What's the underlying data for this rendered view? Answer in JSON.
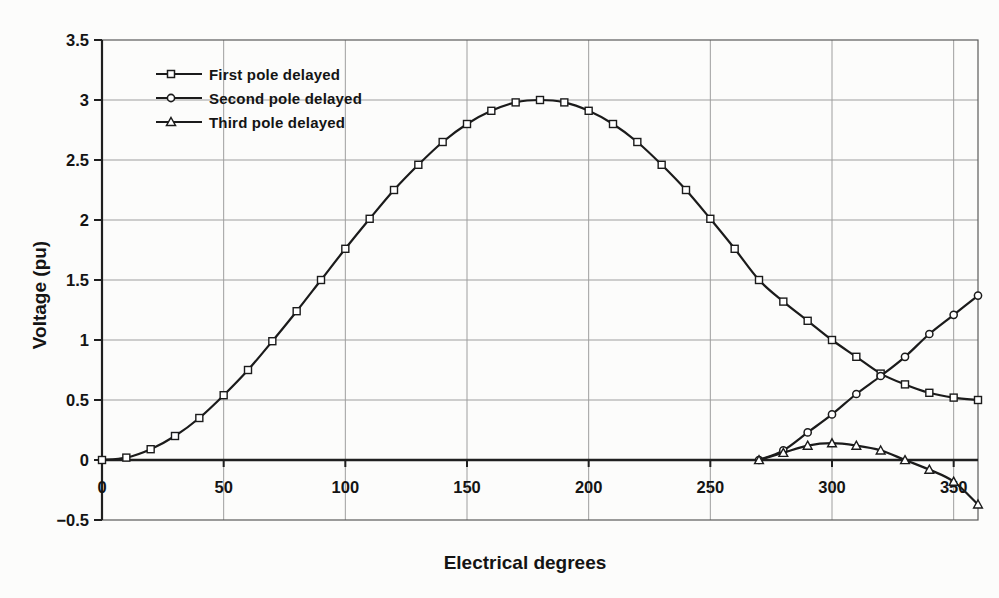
{
  "chart_data": {
    "type": "line",
    "title": "",
    "xlabel": "Electrical degrees",
    "ylabel": "Voltage (pu)",
    "xlim": [
      0,
      360
    ],
    "ylim": [
      -0.5,
      3.5
    ],
    "x_ticks": [
      0,
      50,
      100,
      150,
      200,
      250,
      300,
      350
    ],
    "y_ticks": [
      3.5,
      3,
      2.5,
      2,
      1.5,
      1,
      0.5,
      0,
      -0.5
    ],
    "y_tick_labels": [
      "3.5",
      "3",
      "2.5",
      "2",
      "1.5",
      "1",
      "0.5",
      "0",
      "-0.5"
    ],
    "grid": true,
    "legend_position": "top-left-inside",
    "colors": {
      "line": "#1b1b1b",
      "grid": "#9e9e9e",
      "border": "#5a5a5a",
      "axis": "#1f1f1f",
      "text": "#141414",
      "marker_fill": "#ffffff"
    },
    "series": [
      {
        "name": "First pole delayed",
        "marker": "square",
        "x": [
          0,
          10,
          20,
          30,
          40,
          50,
          60,
          70,
          80,
          90,
          100,
          110,
          120,
          130,
          140,
          150,
          160,
          170,
          180,
          190,
          200,
          210,
          220,
          230,
          240,
          250,
          260,
          270,
          280,
          290,
          300,
          310,
          320,
          330,
          340,
          350,
          360
        ],
        "values": [
          0,
          0.02,
          0.09,
          0.2,
          0.35,
          0.54,
          0.75,
          0.99,
          1.24,
          1.5,
          1.76,
          2.01,
          2.25,
          2.46,
          2.65,
          2.8,
          2.91,
          2.98,
          3.0,
          2.98,
          2.91,
          2.8,
          2.65,
          2.46,
          2.25,
          2.01,
          1.76,
          1.5,
          1.32,
          1.16,
          1.0,
          0.86,
          0.72,
          0.63,
          0.56,
          0.52,
          0.5
        ]
      },
      {
        "name": "Second pole delayed",
        "marker": "circle",
        "x": [
          270,
          280,
          290,
          300,
          310,
          320,
          330,
          340,
          350,
          360
        ],
        "values": [
          0,
          0.08,
          0.23,
          0.38,
          0.55,
          0.7,
          0.86,
          1.05,
          1.21,
          1.37
        ]
      },
      {
        "name": "Third pole delayed",
        "marker": "triangle",
        "x": [
          270,
          280,
          290,
          300,
          310,
          320,
          330,
          340,
          350,
          360
        ],
        "values": [
          0,
          0.06,
          0.12,
          0.14,
          0.12,
          0.08,
          0,
          -0.08,
          -0.18,
          -0.37
        ]
      }
    ]
  }
}
